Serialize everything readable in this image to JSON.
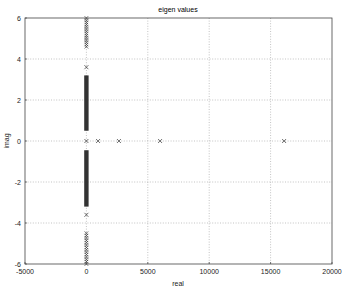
{
  "chart_data": {
    "type": "scatter",
    "title": "eigen values",
    "xlabel": "real",
    "ylabel": "imag",
    "xlim": [
      -5000,
      20000
    ],
    "ylim": [
      -6,
      6
    ],
    "x_ticks": [
      -5000,
      0,
      5000,
      10000,
      15000,
      20000
    ],
    "x_tick_labels": [
      "-5000",
      "0",
      "5000",
      "10000",
      "15000",
      "20000"
    ],
    "y_ticks": [
      6,
      4,
      2,
      0,
      -2,
      -4,
      -6
    ],
    "y_tick_labels": [
      "6",
      "4",
      "2",
      "0",
      "-2",
      "-4",
      "-6"
    ],
    "grid": true,
    "legend": null,
    "marker": "x",
    "series": [
      {
        "name": "eigen values",
        "points_real_axis": [
          {
            "x": 0,
            "y": 0
          },
          {
            "x": 950,
            "y": 0
          },
          {
            "x": 2650,
            "y": 0
          },
          {
            "x": 6000,
            "y": 0
          },
          {
            "x": 16100,
            "y": 0
          }
        ],
        "points_isolated": [
          {
            "x": 0,
            "y": 3.6
          },
          {
            "x": 0,
            "y": -3.6
          }
        ],
        "dense_bands_at_x0": [
          {
            "y_from": 0.5,
            "y_to": 3.2
          },
          {
            "y_from": -3.2,
            "y_to": -0.45
          }
        ],
        "marker_clusters_at_x0": [
          {
            "y_from": 4.6,
            "y_to": 6.0,
            "count": 14
          },
          {
            "y_from": -6.0,
            "y_to": -4.5,
            "count": 14
          }
        ]
      }
    ]
  }
}
